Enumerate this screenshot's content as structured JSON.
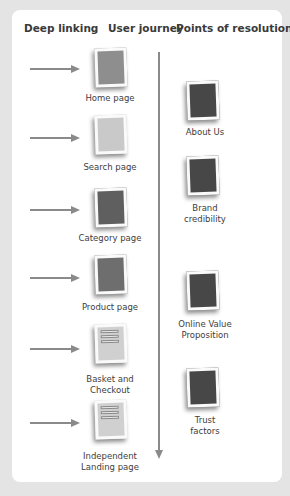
{
  "headers": {
    "deep_linking": "Deep linking",
    "user_journey": "User journey",
    "points_of_resolution": "Points of resolution"
  },
  "colors": {
    "background": "#e4e4e4",
    "card": "#ffffff",
    "arrow": "#8a8a8a",
    "text": "#3d3d3d"
  },
  "user_journey": [
    {
      "label": "Home page",
      "fill": "#8e8e8e",
      "icon": "page-icon"
    },
    {
      "label": "Search page",
      "fill": "#c9c9c9",
      "icon": "page-icon"
    },
    {
      "label": "Category page",
      "fill": "#5f5f5f",
      "icon": "page-icon"
    },
    {
      "label": "Product page",
      "fill": "#6e6e6e",
      "icon": "page-icon"
    },
    {
      "label": "Basket and\nCheckout",
      "fill": "#d0d0d0",
      "icon": "form-page-icon"
    },
    {
      "label": "Independent\nLanding page",
      "fill": "#d0d0d0",
      "icon": "form-page-icon"
    }
  ],
  "points_of_resolution": [
    {
      "label": "About Us",
      "fill": "#474747",
      "icon": "page-icon"
    },
    {
      "label": "Brand\ncredibility",
      "fill": "#474747",
      "icon": "page-icon"
    },
    {
      "label": "Online Value\nProposition",
      "fill": "#474747",
      "icon": "page-icon"
    },
    {
      "label": "Trust\nfactors",
      "fill": "#474747",
      "icon": "page-icon"
    }
  ]
}
